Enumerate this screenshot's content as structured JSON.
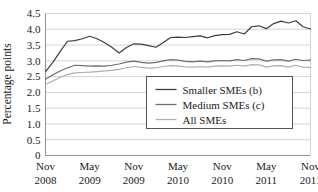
{
  "chart_data": {
    "type": "line",
    "title": "",
    "xlabel": "",
    "ylabel": "Percentage points",
    "ylim": [
      0,
      4.5
    ],
    "ytick_step": 0.5,
    "yticks": [
      "0",
      "0.5",
      "1.0",
      "1.5",
      "2.0",
      "2.5",
      "3.0",
      "3.5",
      "4.0",
      "4.5"
    ],
    "grid": true,
    "grid_axis": "y",
    "legend_position": "center-bottom-inside",
    "xticks": [
      {
        "month": "Nov",
        "year": "2008",
        "index": 0
      },
      {
        "month": "May",
        "year": "2009",
        "index": 6
      },
      {
        "month": "Nov",
        "year": "2009",
        "index": 12
      },
      {
        "month": "May",
        "year": "2010",
        "index": 18
      },
      {
        "month": "Nov",
        "year": "2010",
        "index": 24
      },
      {
        "month": "May",
        "year": "2011",
        "index": 30
      },
      {
        "month": "Nov",
        "year": "2011",
        "index": 36
      }
    ],
    "x": [
      0,
      1,
      2,
      3,
      4,
      5,
      6,
      7,
      8,
      9,
      10,
      11,
      12,
      13,
      14,
      15,
      16,
      17,
      18,
      19,
      20,
      21,
      22,
      23,
      24,
      25,
      26,
      27,
      28,
      29,
      30,
      31,
      32,
      33,
      34,
      35,
      36
    ],
    "series": [
      {
        "name": "Smaller SMEs (b)",
        "color": "#3d3d3d",
        "values": [
          2.66,
          2.95,
          3.3,
          3.62,
          3.64,
          3.7,
          3.78,
          3.7,
          3.58,
          3.43,
          3.25,
          3.42,
          3.54,
          3.53,
          3.48,
          3.43,
          3.58,
          3.74,
          3.75,
          3.74,
          3.77,
          3.79,
          3.73,
          3.8,
          3.83,
          3.84,
          3.92,
          3.85,
          4.08,
          4.11,
          4.02,
          4.18,
          4.26,
          4.2,
          4.27,
          4.08,
          4.01
        ]
      },
      {
        "name": "Medium SMEs (c)",
        "color": "#6f6f6f",
        "values": [
          2.42,
          2.56,
          2.68,
          2.78,
          2.86,
          2.85,
          2.83,
          2.84,
          2.83,
          2.86,
          2.9,
          2.96,
          2.99,
          2.95,
          2.93,
          2.95,
          3.0,
          3.04,
          3.02,
          2.98,
          2.97,
          2.99,
          2.97,
          3.0,
          3.01,
          3.0,
          3.04,
          3.01,
          3.07,
          3.06,
          2.99,
          3.03,
          3.04,
          2.99,
          3.05,
          3.01,
          3.02
        ]
      },
      {
        "name": "All SMEs",
        "color": "#aeaeae",
        "values": [
          2.25,
          2.36,
          2.48,
          2.57,
          2.62,
          2.63,
          2.64,
          2.66,
          2.68,
          2.7,
          2.73,
          2.78,
          2.82,
          2.79,
          2.77,
          2.78,
          2.82,
          2.85,
          2.84,
          2.81,
          2.8,
          2.82,
          2.8,
          2.83,
          2.84,
          2.83,
          2.86,
          2.83,
          2.88,
          2.87,
          2.8,
          2.84,
          2.85,
          2.8,
          2.86,
          2.8,
          2.79
        ]
      }
    ],
    "legend_entries": [
      {
        "label": "Smaller SMEs (b)",
        "color": "#3d3d3d"
      },
      {
        "label": "Medium SMEs (c)",
        "color": "#6f6f6f"
      },
      {
        "label": "All SMEs",
        "color": "#aeaeae"
      }
    ],
    "colors": {
      "axis": "#808080",
      "grid": "#d4d4d4",
      "legend_border": "#555555",
      "background": "#ffffff"
    }
  }
}
